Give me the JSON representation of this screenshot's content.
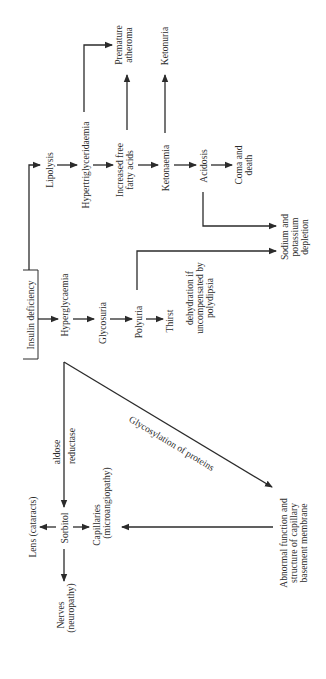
{
  "diagram": {
    "orientation": "rotated 90 degrees counter-clockwise",
    "root": {
      "label": "Insulin deficiency"
    },
    "main_chain": [
      {
        "id": "hyperglycaemia",
        "lines": [
          "Hyperglycaemia"
        ]
      },
      {
        "id": "glycosuria",
        "lines": [
          "Glycosuria"
        ]
      },
      {
        "id": "polyuria",
        "lines": [
          "Polyuria"
        ]
      },
      {
        "id": "thirst",
        "lines": [
          "Thirst"
        ]
      }
    ],
    "dehydration": {
      "lines": [
        "dehydration if",
        "uncompensated by",
        "polydipsia"
      ]
    },
    "lipid_chain": [
      {
        "id": "lipolysis",
        "lines": [
          "Lipolysis"
        ]
      },
      {
        "id": "hypertriglyceridaemia",
        "lines": [
          "Hypertriglyceridaemia"
        ]
      },
      {
        "id": "increased-ffa",
        "lines": [
          "Increased free",
          "fatty acids"
        ]
      },
      {
        "id": "ketonaemia",
        "lines": [
          "Ketonaemia"
        ]
      },
      {
        "id": "acidosis",
        "lines": [
          "Acidosis"
        ]
      },
      {
        "id": "coma",
        "lines": [
          "Coma and",
          "death"
        ]
      }
    ],
    "premature_atheroma": {
      "lines": [
        "Premature",
        "atheroma"
      ]
    },
    "ketonuria": {
      "lines": [
        "Ketonuria"
      ]
    },
    "sodium_potassium": {
      "lines": [
        "Sodium and",
        "potassium",
        "depletion"
      ]
    },
    "sorbitol_pathway": {
      "enzyme": [
        "aldose",
        "reductase"
      ],
      "sorbitol": "Sorbitol",
      "lens": "Lens (cataracts)",
      "nerves": [
        "Nerves",
        "(neuropathy)"
      ],
      "capillaries": [
        "Capillaries",
        "(microangiopathy)"
      ]
    },
    "glycosylation_label": "Glycosylation of proteins",
    "abnormal_membrane": {
      "lines": [
        "Abnormal function and",
        "structure of capillary",
        "basement membrane"
      ]
    },
    "edges": [
      [
        "Insulin deficiency",
        "Hyperglycaemia"
      ],
      [
        "Insulin deficiency",
        "Lipolysis"
      ],
      [
        "Hyperglycaemia",
        "Glycosuria"
      ],
      [
        "Glycosuria",
        "Polyuria"
      ],
      [
        "Polyuria",
        "Thirst"
      ],
      [
        "Polyuria",
        "Sodium and potassium depletion"
      ],
      [
        "Lipolysis",
        "Hypertriglyceridaemia"
      ],
      [
        "Hypertriglyceridaemia",
        "Increased free fatty acids"
      ],
      [
        "Hypertriglyceridaemia",
        "Premature atheroma"
      ],
      [
        "Increased free fatty acids",
        "Premature atheroma"
      ],
      [
        "Increased free fatty acids",
        "Ketonaemia"
      ],
      [
        "Ketonaemia",
        "Ketonuria"
      ],
      [
        "Ketonaemia",
        "Acidosis"
      ],
      [
        "Acidosis",
        "Coma and death"
      ],
      [
        "Acidosis",
        "Sodium and potassium depletion"
      ],
      [
        "Hyperglycaemia",
        "Sorbitol"
      ],
      [
        "Hyperglycaemia",
        "Abnormal function and structure of capillary basement membrane"
      ],
      [
        "Sorbitol",
        "Lens (cataracts)"
      ],
      [
        "Sorbitol",
        "Nerves (neuropathy)"
      ],
      [
        "Sorbitol",
        "Capillaries (microangiopathy)"
      ],
      [
        "Abnormal function and structure of capillary basement membrane",
        "Capillaries (microangiopathy)"
      ]
    ]
  }
}
